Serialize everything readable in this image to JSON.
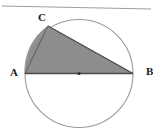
{
  "figure": {
    "kind": "circle-geometry-diagram",
    "width": 153,
    "height": 133,
    "background_color": "#ffffff"
  },
  "labels": {
    "vertex_c": "C",
    "vertex_a": "A",
    "vertex_b": "B"
  },
  "colors": {
    "shaded_region": "#8d8d8d",
    "circle_stroke": "#9a9a9a",
    "chord_stroke": "#4a4a4a",
    "top_rule": "#9e9e9e",
    "center_dot": "#333333",
    "label_text": "#1a1a1a"
  },
  "geometry": {
    "circle": {
      "cx": 79,
      "cy": 73.5,
      "r": 54
    },
    "center_point": {
      "x": 79,
      "y": 73.5
    },
    "points": {
      "A": {
        "x": 25,
        "y": 73.5
      },
      "B": {
        "x": 133,
        "y": 73.5
      },
      "C": {
        "x": 48,
        "y": 26
      }
    },
    "top_rule": {
      "x1": 2,
      "y1": 6,
      "x2": 151,
      "y2": 9
    },
    "shaded_description": "circular segment on arc A-C together with triangle A-C-B, filled gray"
  }
}
